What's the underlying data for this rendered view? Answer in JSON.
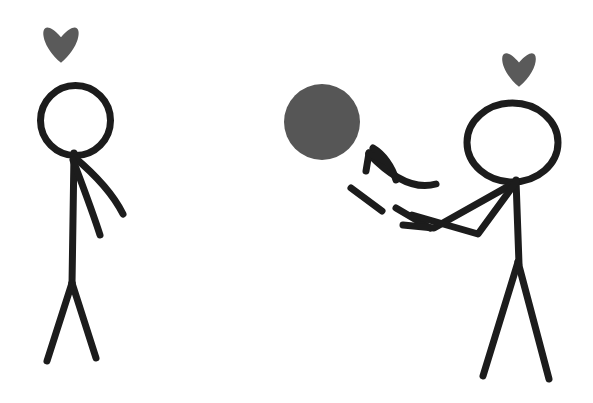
{
  "scene": {
    "title": "Stick figure throwing a ball to another stick figure",
    "width": 593,
    "height": 403,
    "background_color": "#ffffff",
    "ink_color": "#1c1c1c",
    "accent_gray": "#5a5a5a",
    "stroke_width": 7
  },
  "figures": [
    {
      "id": "left-figure",
      "label": "Receiving stick figure",
      "heart": {
        "label": "love heart above left figure",
        "color": "#5a5a5a",
        "cx": 61,
        "cy": 42,
        "size": 40
      },
      "head": {
        "label": "left figure head",
        "cx": 75.5,
        "cy": 120.5,
        "rx": 35,
        "ry": 35
      },
      "torso": {
        "label": "left figure torso",
        "x1": 74,
        "y1": 153,
        "x2": 72,
        "y2": 285
      },
      "arms": [
        {
          "label": "left figure upper arm",
          "path": "M 74 157 C 92 172, 112 192, 123 214"
        },
        {
          "label": "left figure lower arm",
          "path": "M 73 160 C 82 184, 92 210, 100 235"
        }
      ],
      "legs": [
        {
          "label": "left figure left leg",
          "path": "M 72 283 L 47 361"
        },
        {
          "label": "left figure right leg",
          "path": "M 72 283 L 96 358"
        }
      ]
    },
    {
      "id": "right-figure",
      "label": "Throwing stick figure",
      "heart": {
        "label": "love heart above right figure",
        "color": "#5a5a5a",
        "cx": 519,
        "cy": 67,
        "size": 38
      },
      "head": {
        "label": "right figure head",
        "cx": 512.5,
        "cy": 142.5,
        "rx": 45.5,
        "ry": 39.5
      },
      "torso": {
        "label": "right figure torso",
        "x1": 516,
        "y1": 180,
        "x2": 519,
        "y2": 264
      },
      "arms": [
        {
          "label": "right figure upper arm",
          "path": "M 516 182 L 434 228 L 403 225"
        },
        {
          "label": "right figure lower arm",
          "path": "M 516 182 L 478 234 L 412 215"
        }
      ],
      "legs": [
        {
          "label": "right figure left leg",
          "path": "M 518 262 L 483 376"
        },
        {
          "label": "right figure right leg",
          "path": "M 518 262 L 549 379"
        }
      ]
    }
  ],
  "ball": {
    "label": "thrown ball",
    "color": "#565656",
    "cx": 322,
    "cy": 122,
    "r": 38
  },
  "motion": {
    "label": "motion trail toward the ball",
    "arrow": {
      "label": "motion arrow pointing at ball",
      "shaft": "M 436 184 C 415 190, 392 178, 369 154",
      "head_left": "M 369 153 L 366 171",
      "head_right": "M 369 153 L 385 161"
    },
    "streaks": [
      {
        "label": "upper motion streak",
        "path": "M 373 148 C 383 154, 392 166, 396 180"
      },
      {
        "label": "lower-left motion streak",
        "path": "M 351 188 L 382 211"
      },
      {
        "label": "lower-right motion streak",
        "path": "M 396 208 L 430 228"
      }
    ]
  }
}
